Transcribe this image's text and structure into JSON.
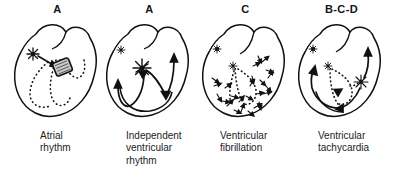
{
  "figure": {
    "panel_count": 4,
    "stroke_color": "#111111",
    "fill_color": "#ffffff",
    "caption_color": "#1c1c1c"
  },
  "panels": [
    {
      "letter": "A",
      "caption": "Atrial\nrhythm",
      "caption_lines": [
        "Atrial",
        "rhythm"
      ],
      "markers": {
        "sa_node": "starburst-large",
        "av_node": "shaded-rounded-rectangle",
        "conduction": "dotted-purkinje-network",
        "arrows": "single-arrow-sa-to-av"
      }
    },
    {
      "letter": "A",
      "caption": "Independent\nventricular\nrhythm",
      "caption_lines": [
        "Independent",
        "ventricular",
        "rhythm"
      ],
      "markers": {
        "sa_node": "starburst-small",
        "ectopic_focus": "starburst-large-center",
        "arrows": "bilateral-loop-arrows"
      }
    },
    {
      "letter": "C",
      "caption": "Ventricular\nfibrillation",
      "caption_lines": [
        "Ventricular",
        "fibrillation"
      ],
      "markers": {
        "sa_node": "starburst-small",
        "av_node": "starburst-small",
        "conduction": "dotted-purkinje-network",
        "arrows": "chaotic-multifocal-arrows"
      }
    },
    {
      "letter": "B-C-D",
      "caption": "Ventricular\ntachycardia",
      "caption_lines": [
        "Ventricular",
        "tachycardia"
      ],
      "markers": {
        "sa_node": "starburst-small",
        "av_node": "starburst-small",
        "ectopic_focus": "starburst-right-ventricle",
        "conduction": "dotted-purkinje-network",
        "arrows": "sweeping-bilateral-arrows"
      }
    }
  ]
}
